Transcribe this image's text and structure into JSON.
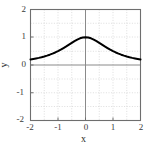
{
  "chart_data": {
    "type": "line",
    "title": "",
    "xlabel": "x",
    "ylabel": "y",
    "xlim": [
      -2,
      2
    ],
    "ylim": [
      -2,
      2
    ],
    "xticks": [
      -2,
      -1,
      0,
      1,
      2
    ],
    "yticks": [
      -2,
      -1,
      0,
      1,
      2
    ],
    "xtick_labels": [
      "-2",
      "-1",
      "0",
      "1",
      "2"
    ],
    "ytick_labels": [
      "-2",
      "-1",
      "0",
      "1",
      "2"
    ],
    "grid": true,
    "grid_style": "dotted",
    "grid_minor_step": 0.5,
    "legend": null,
    "series": [
      {
        "name": "y = 1/(1+x^2)",
        "color": "#000000",
        "linewidth": 2,
        "x": [
          -2.0,
          -1.9,
          -1.8,
          -1.7,
          -1.6,
          -1.5,
          -1.4,
          -1.3,
          -1.2,
          -1.1,
          -1.0,
          -0.9,
          -0.8,
          -0.7,
          -0.6,
          -0.5,
          -0.4,
          -0.3,
          -0.2,
          -0.1,
          0.0,
          0.1,
          0.2,
          0.3,
          0.4,
          0.5,
          0.6,
          0.7,
          0.8,
          0.9,
          1.0,
          1.1,
          1.2,
          1.3,
          1.4,
          1.5,
          1.6,
          1.7,
          1.8,
          1.9,
          2.0
        ],
        "y": [
          0.2,
          0.217,
          0.236,
          0.257,
          0.281,
          0.308,
          0.338,
          0.372,
          0.409,
          0.452,
          0.5,
          0.552,
          0.61,
          0.671,
          0.735,
          0.8,
          0.862,
          0.917,
          0.962,
          0.99,
          1.0,
          0.99,
          0.962,
          0.917,
          0.862,
          0.8,
          0.735,
          0.671,
          0.61,
          0.552,
          0.5,
          0.452,
          0.409,
          0.372,
          0.338,
          0.308,
          0.281,
          0.257,
          0.236,
          0.217,
          0.2
        ]
      }
    ]
  },
  "style": {
    "frame_color": "#6e6e6e",
    "axis_color": "#8a8a8a",
    "grid_color": "#cfcfcf",
    "curve_color": "#000000",
    "text_color": "#333333",
    "background": "#ffffff"
  },
  "axis_titles": {
    "x": "x",
    "y": "y"
  }
}
